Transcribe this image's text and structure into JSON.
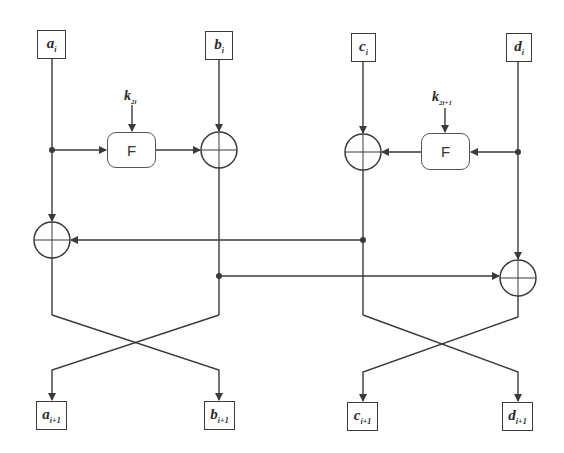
{
  "diagram": {
    "type": "feistel-like round structure (generalized Feistel network, one round)",
    "inputs": [
      {
        "var": "a",
        "sub": "i"
      },
      {
        "var": "b",
        "sub": "i"
      },
      {
        "var": "c",
        "sub": "i"
      },
      {
        "var": "d",
        "sub": "i"
      }
    ],
    "outputs": [
      {
        "var": "a",
        "sub": "i+1"
      },
      {
        "var": "b",
        "sub": "i+1"
      },
      {
        "var": "c",
        "sub": "i+1"
      },
      {
        "var": "d",
        "sub": "i+1"
      }
    ],
    "functions": [
      {
        "label": "F",
        "key_var": "k",
        "key_sub": "2i"
      },
      {
        "label": "F",
        "key_var": "k",
        "key_sub": "2i+1"
      }
    ],
    "colors": {
      "line": "#3a3a3a",
      "background": "#ffffff"
    }
  }
}
